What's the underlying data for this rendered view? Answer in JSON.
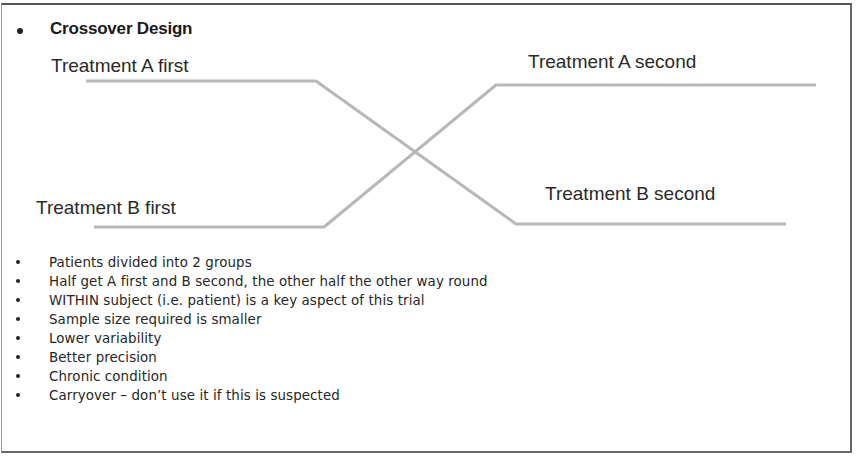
{
  "slide": {
    "title": "Crossover Design",
    "diagram": {
      "labels": {
        "a_first": "Treatment A first",
        "a_second": "Treatment A second",
        "b_first": "Treatment B first",
        "b_second": "Treatment B second"
      },
      "line_color": "#b8b8b8"
    },
    "bullets": [
      "Patients divided into 2 groups",
      "Half get A first and B second, the other half the other way round",
      "WITHIN subject (i.e. patient) is a key aspect of this trial",
      "Sample size required is smaller",
      "Lower variability",
      "Better precision",
      "Chronic condition",
      "Carryover – don’t use it if this is suspected"
    ]
  }
}
